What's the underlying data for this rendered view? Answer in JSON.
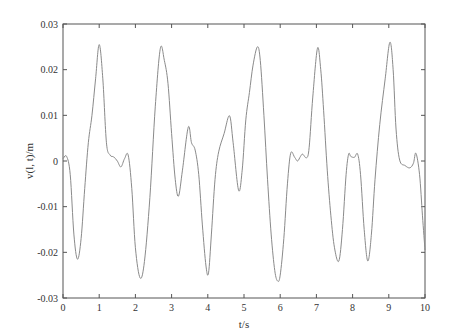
{
  "chart_data": {
    "type": "line",
    "title": "",
    "xlabel": "t/s",
    "ylabel": "v(l, t)/m",
    "xlim": [
      0,
      10
    ],
    "ylim": [
      -0.03,
      0.03
    ],
    "xticks": [
      0,
      1,
      2,
      3,
      4,
      5,
      6,
      7,
      8,
      9,
      10
    ],
    "xtick_labels": [
      "0",
      "1",
      "2",
      "3",
      "4",
      "5",
      "6",
      "7",
      "8",
      "9",
      "10"
    ],
    "yticks": [
      -0.03,
      -0.02,
      -0.01,
      0,
      0.01,
      0.02,
      0.03
    ],
    "ytick_labels": [
      "-0.03",
      "-0.02",
      "-0.01",
      "0",
      "0.01",
      "0.02",
      "0.03"
    ],
    "grid": false,
    "legend": null,
    "line_color": "#8a8a8a",
    "series": [
      {
        "name": "v(l, t)",
        "x": [
          0,
          0.1,
          0.2,
          0.3,
          0.4,
          0.5,
          0.6,
          0.7,
          0.8,
          0.9,
          1.0,
          1.1,
          1.2,
          1.3,
          1.4,
          1.5,
          1.6,
          1.7,
          1.8,
          1.9,
          2.0,
          2.13,
          2.25,
          2.4,
          2.55,
          2.69,
          2.8,
          2.9,
          3.0,
          3.1,
          3.19,
          3.3,
          3.46,
          3.55,
          3.65,
          3.75,
          3.85,
          3.95,
          4.02,
          4.1,
          4.2,
          4.3,
          4.45,
          4.6,
          4.7,
          4.85,
          4.95,
          5.05,
          5.15,
          5.25,
          5.37,
          5.45,
          5.55,
          5.65,
          5.75,
          5.85,
          5.93,
          6.0,
          6.1,
          6.2,
          6.29,
          6.4,
          6.48,
          6.56,
          6.62,
          6.73,
          6.8,
          6.9,
          7.03,
          7.12,
          7.2,
          7.3,
          7.4,
          7.5,
          7.62,
          7.72,
          7.82,
          7.89,
          7.95,
          8.05,
          8.14,
          8.22,
          8.32,
          8.42,
          8.52,
          8.62,
          8.75,
          8.9,
          9.03,
          9.12,
          9.2,
          9.3,
          9.45,
          9.58,
          9.68,
          9.75,
          9.85,
          9.93,
          10.0
        ],
        "y": [
          0.0005,
          0.001,
          -0.003,
          -0.016,
          -0.0215,
          -0.017,
          -0.006,
          0.004,
          0.01,
          0.018,
          0.0255,
          0.018,
          0.004,
          0.0013,
          0.0009,
          0.0,
          -0.0013,
          0.0005,
          0.0013,
          -0.006,
          -0.019,
          -0.0256,
          -0.022,
          -0.008,
          0.012,
          0.0247,
          0.022,
          0.017,
          0.006,
          -0.004,
          -0.0077,
          -0.002,
          0.0074,
          0.004,
          0.0024,
          -0.003,
          -0.014,
          -0.023,
          -0.0245,
          -0.016,
          -0.004,
          0.002,
          0.006,
          0.0099,
          0.004,
          -0.0064,
          -0.002,
          0.009,
          0.015,
          0.021,
          0.025,
          0.022,
          0.01,
          -0.004,
          -0.016,
          -0.024,
          -0.0263,
          -0.025,
          -0.017,
          -0.005,
          0.0017,
          0.0008,
          0.0,
          0.001,
          0.0015,
          0.0007,
          0.003,
          0.014,
          0.0247,
          0.02,
          0.011,
          -0.002,
          -0.012,
          -0.019,
          -0.0219,
          -0.015,
          -0.003,
          0.0015,
          0.001,
          0.0008,
          0.0015,
          -0.003,
          -0.015,
          -0.0219,
          -0.016,
          -0.004,
          0.008,
          0.018,
          0.026,
          0.02,
          0.007,
          0.0002,
          -0.001,
          -0.0015,
          -0.0005,
          0.0017,
          -0.003,
          -0.012,
          -0.0195
        ]
      }
    ]
  }
}
